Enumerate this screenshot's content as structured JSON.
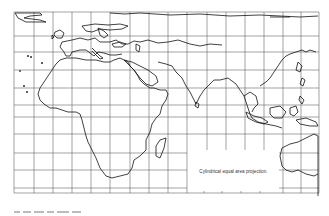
{
  "figure": {
    "type": "world-map",
    "projection_label": "Cylindrical equal area projection.",
    "region": "Europe, Africa, Asia, Indian Ocean, Australia (partial)",
    "grid": {
      "vertical_lines_x": [
        14,
        34,
        53,
        72,
        91,
        110,
        130,
        149,
        168,
        187,
        207,
        226,
        245,
        264,
        283,
        301,
        319
      ],
      "horizontal_lines_y": [
        12,
        23,
        36,
        52,
        70,
        88,
        105,
        117,
        134,
        153,
        170,
        188
      ],
      "bottom_ticks_x": [
        204,
        222,
        241,
        260
      ],
      "color": "#555555"
    },
    "coastline_color": "#111111",
    "background": "#ffffff",
    "caption_visible": false
  }
}
